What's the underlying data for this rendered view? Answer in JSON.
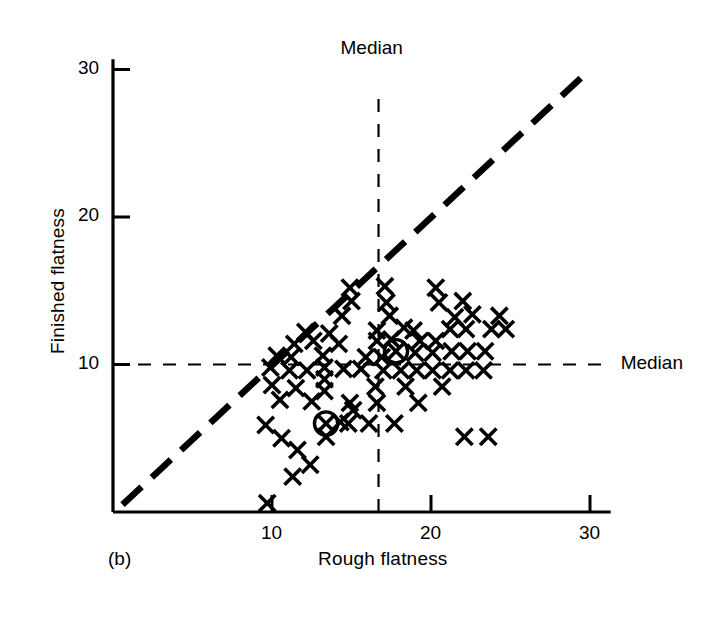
{
  "figure": {
    "panel_label": "(b)",
    "background": "#ffffff",
    "ink": "#000000"
  },
  "chart_data": {
    "type": "scatter",
    "title": "",
    "xlabel": "Rough flatness",
    "ylabel": "Finished flatness",
    "xlim": [
      0,
      32
    ],
    "ylim": [
      0,
      31.5
    ],
    "xticks": [
      10,
      20,
      30
    ],
    "yticks": [
      10,
      20,
      30
    ],
    "xtick_labels": [
      "10",
      "20",
      "30"
    ],
    "ytick_labels": [
      "10",
      "20",
      "30"
    ],
    "grid": false,
    "legend": "none",
    "marker": "x",
    "annotations": [
      {
        "text": "Median",
        "kind": "vertical-median-label",
        "x": 16.7,
        "y": 30.6
      },
      {
        "text": "Median",
        "kind": "horizontal-median-label",
        "x": 31.2,
        "y": 10.0
      }
    ],
    "reference_lines": [
      {
        "name": "identity-line",
        "kind": "diagonal-dashed-thick",
        "from": [
          0.6,
          0.5
        ],
        "to": [
          29.5,
          29.5
        ]
      },
      {
        "name": "median-vertical",
        "kind": "vertical-dashed-thin",
        "x": 16.7,
        "y_from": 0.0,
        "y_to": 28.5
      },
      {
        "name": "median-horizontal",
        "kind": "horizontal-dashed-thin",
        "y": 10.0,
        "x_from": 0.0,
        "x_to": 31.2
      }
    ],
    "median_x": 16.7,
    "median_y": 10.0,
    "points": [
      {
        "x": 9.7,
        "y": 0.6
      },
      {
        "x": 11.3,
        "y": 2.4
      },
      {
        "x": 12.4,
        "y": 3.2
      },
      {
        "x": 11.6,
        "y": 4.2
      },
      {
        "x": 10.6,
        "y": 5.0
      },
      {
        "x": 9.6,
        "y": 5.9
      },
      {
        "x": 13.4,
        "y": 5.1
      },
      {
        "x": 13.4,
        "y": 6.0,
        "circled": true
      },
      {
        "x": 14.3,
        "y": 6.1
      },
      {
        "x": 15.1,
        "y": 6.9
      },
      {
        "x": 14.8,
        "y": 6.0
      },
      {
        "x": 16.1,
        "y": 6.0
      },
      {
        "x": 17.7,
        "y": 6.0
      },
      {
        "x": 22.1,
        "y": 5.1
      },
      {
        "x": 23.6,
        "y": 5.1
      },
      {
        "x": 10.5,
        "y": 7.6
      },
      {
        "x": 12.5,
        "y": 7.5
      },
      {
        "x": 14.9,
        "y": 7.4
      },
      {
        "x": 16.6,
        "y": 7.4
      },
      {
        "x": 19.2,
        "y": 7.4
      },
      {
        "x": 10.0,
        "y": 8.6
      },
      {
        "x": 11.5,
        "y": 8.4
      },
      {
        "x": 13.3,
        "y": 8.2
      },
      {
        "x": 13.3,
        "y": 9.0
      },
      {
        "x": 16.5,
        "y": 8.5
      },
      {
        "x": 18.4,
        "y": 8.5
      },
      {
        "x": 20.7,
        "y": 8.5
      },
      {
        "x": 9.9,
        "y": 9.8
      },
      {
        "x": 11.1,
        "y": 9.6
      },
      {
        "x": 12.2,
        "y": 9.6
      },
      {
        "x": 13.3,
        "y": 9.8
      },
      {
        "x": 14.5,
        "y": 9.7
      },
      {
        "x": 15.6,
        "y": 9.7
      },
      {
        "x": 17.0,
        "y": 9.6
      },
      {
        "x": 18.1,
        "y": 9.6
      },
      {
        "x": 19.1,
        "y": 9.6
      },
      {
        "x": 20.1,
        "y": 9.6
      },
      {
        "x": 21.2,
        "y": 9.6
      },
      {
        "x": 22.2,
        "y": 9.6
      },
      {
        "x": 23.3,
        "y": 9.6
      },
      {
        "x": 10.3,
        "y": 10.6
      },
      {
        "x": 11.2,
        "y": 10.5
      },
      {
        "x": 13.2,
        "y": 10.6
      },
      {
        "x": 15.9,
        "y": 10.5
      },
      {
        "x": 16.9,
        "y": 10.5
      },
      {
        "x": 17.8,
        "y": 10.9,
        "circled": true
      },
      {
        "x": 19.0,
        "y": 10.8
      },
      {
        "x": 20.1,
        "y": 10.8
      },
      {
        "x": 21.3,
        "y": 10.9
      },
      {
        "x": 22.3,
        "y": 10.9
      },
      {
        "x": 23.4,
        "y": 10.9
      },
      {
        "x": 11.4,
        "y": 11.4
      },
      {
        "x": 12.6,
        "y": 11.6
      },
      {
        "x": 14.2,
        "y": 11.4
      },
      {
        "x": 16.6,
        "y": 11.6
      },
      {
        "x": 17.5,
        "y": 11.7
      },
      {
        "x": 19.3,
        "y": 11.6
      },
      {
        "x": 20.3,
        "y": 11.6
      },
      {
        "x": 12.1,
        "y": 12.2
      },
      {
        "x": 13.6,
        "y": 12.1
      },
      {
        "x": 16.6,
        "y": 12.3
      },
      {
        "x": 18.3,
        "y": 12.5
      },
      {
        "x": 18.9,
        "y": 12.3
      },
      {
        "x": 21.2,
        "y": 12.4
      },
      {
        "x": 22.2,
        "y": 12.4
      },
      {
        "x": 23.8,
        "y": 12.4
      },
      {
        "x": 24.7,
        "y": 12.4
      },
      {
        "x": 14.4,
        "y": 13.3
      },
      {
        "x": 17.4,
        "y": 13.3
      },
      {
        "x": 21.5,
        "y": 13.2
      },
      {
        "x": 22.6,
        "y": 13.4
      },
      {
        "x": 24.3,
        "y": 13.3
      },
      {
        "x": 15.0,
        "y": 14.3
      },
      {
        "x": 17.2,
        "y": 14.2
      },
      {
        "x": 20.5,
        "y": 14.2
      },
      {
        "x": 22.0,
        "y": 14.3
      },
      {
        "x": 14.9,
        "y": 15.2
      },
      {
        "x": 17.1,
        "y": 15.3
      },
      {
        "x": 20.3,
        "y": 15.2
      }
    ]
  },
  "axes": {
    "y_axis_name": "finished-flatness-axis",
    "x_axis_name": "rough-flatness-axis"
  }
}
